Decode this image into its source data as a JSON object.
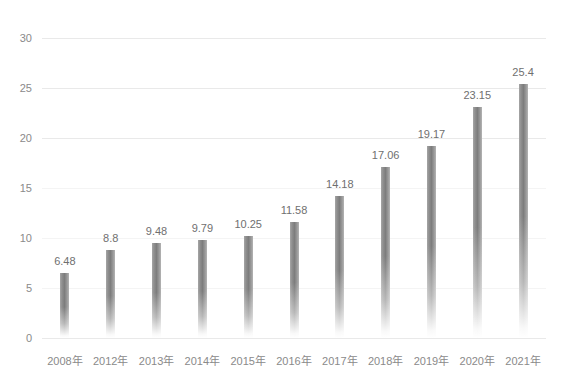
{
  "chart_data": {
    "type": "bar",
    "title": "",
    "xlabel": "",
    "ylabel": "",
    "ylim": [
      0,
      30
    ],
    "yticks": [
      0,
      5,
      10,
      15,
      20,
      25,
      30
    ],
    "grid": true,
    "legend": null,
    "categories": [
      "2008年",
      "2012年",
      "2013年",
      "2014年",
      "2015年",
      "2016年",
      "2017年",
      "2018年",
      "2019年",
      "2020年",
      "2021年"
    ],
    "values": [
      6.48,
      8.8,
      9.48,
      9.79,
      10.25,
      11.58,
      14.18,
      17.06,
      19.17,
      23.15,
      25.4
    ],
    "value_labels": [
      "6.48",
      "8.8",
      "9.48",
      "9.79",
      "10.25",
      "11.58",
      "14.18",
      "17.06",
      "19.17",
      "23.15",
      "25.4"
    ],
    "ytick_labels": [
      "0",
      "5",
      "10",
      "15",
      "20",
      "25",
      "30"
    ],
    "bar_color": "#8f8f8f",
    "gridline_color": "#e9e9e9",
    "text_color": "#8a8a8a"
  }
}
